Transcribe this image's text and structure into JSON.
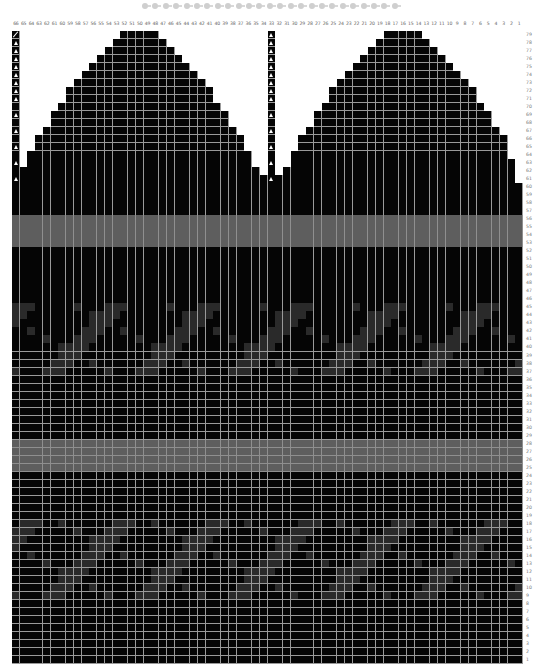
{
  "chart_meta": {
    "title": "Knitting chart",
    "columns": 66,
    "rows": 79,
    "progress_dots": 25
  },
  "column_labels": [
    66,
    65,
    64,
    63,
    62,
    61,
    60,
    59,
    58,
    57,
    56,
    55,
    54,
    53,
    52,
    51,
    50,
    49,
    48,
    47,
    46,
    45,
    44,
    43,
    42,
    41,
    40,
    39,
    38,
    37,
    36,
    35,
    34,
    33,
    32,
    31,
    30,
    29,
    28,
    27,
    26,
    25,
    24,
    23,
    22,
    21,
    20,
    19,
    18,
    17,
    16,
    15,
    14,
    13,
    12,
    11,
    10,
    9,
    8,
    7,
    6,
    5,
    4,
    3,
    2,
    1
  ],
  "row_labels_order": "79 at top down to 1 at bottom",
  "colors": {
    "main": "#050505",
    "background": "#ffffff",
    "grid_line": "#9a9a9a",
    "contrast_dark": "#2a2a2a",
    "band_mid": "#5e5e5e",
    "band_light": "#7b7b7b"
  },
  "shaping": {
    "top_rows": [
      {
        "row": 79,
        "left": [
          52,
          48
        ],
        "right": [
          18,
          14
        ]
      },
      {
        "row": 78,
        "left": [
          53,
          47
        ],
        "right": [
          19,
          13
        ]
      },
      {
        "row": 77,
        "left": [
          54,
          46
        ],
        "right": [
          20,
          12
        ]
      },
      {
        "row": 76,
        "left": [
          55,
          45
        ],
        "right": [
          21,
          11
        ]
      },
      {
        "row": 75,
        "left": [
          56,
          44
        ],
        "right": [
          22,
          10
        ]
      },
      {
        "row": 74,
        "left": [
          57,
          43
        ],
        "right": [
          23,
          9
        ]
      },
      {
        "row": 73,
        "left": [
          58,
          42
        ],
        "right": [
          24,
          8
        ]
      },
      {
        "row": 72,
        "left": [
          59,
          41
        ],
        "right": [
          25,
          7
        ]
      },
      {
        "row": 71,
        "left": [
          59,
          41
        ],
        "right": [
          25,
          7
        ]
      },
      {
        "row": 70,
        "left": [
          60,
          40
        ],
        "right": [
          26,
          6
        ]
      },
      {
        "row": 69,
        "left": [
          61,
          39
        ],
        "right": [
          27,
          5
        ]
      },
      {
        "row": 68,
        "left": [
          61,
          39
        ],
        "right": [
          27,
          5
        ]
      },
      {
        "row": 67,
        "left": [
          62,
          38
        ],
        "right": [
          28,
          4
        ]
      },
      {
        "row": 66,
        "left": [
          63,
          37
        ],
        "right": [
          29,
          3
        ]
      },
      {
        "row": 65,
        "left": [
          63,
          37
        ],
        "right": [
          29,
          3
        ]
      },
      {
        "row": 64,
        "left": [
          64,
          36
        ],
        "right": [
          30,
          3
        ]
      },
      {
        "row": 63,
        "left": [
          64,
          36
        ],
        "right": [
          30,
          2
        ]
      },
      {
        "row": 62,
        "left": [
          65,
          35
        ],
        "right": [
          31,
          2
        ]
      },
      {
        "row": 61,
        "left": [
          65,
          34
        ],
        "right": [
          32,
          2
        ]
      }
    ],
    "decrease_marker_columns": [
      66,
      33
    ],
    "decrease_marker_rows": [
      79,
      78,
      77,
      76,
      75,
      74,
      73,
      72,
      71,
      69,
      67,
      65,
      63,
      61
    ],
    "slash_marker": {
      "row": 79,
      "col": 66
    }
  },
  "bands": [
    {
      "rows": [
        56,
        53
      ],
      "shade": "dark_edges"
    },
    {
      "rows": [
        55,
        54
      ],
      "shade": "light"
    },
    {
      "rows": [
        28,
        25
      ],
      "shade": "dark_edges"
    },
    {
      "rows": [
        27,
        26
      ],
      "shade": "light"
    }
  ],
  "motif_blocks": [
    {
      "rows": [
        45,
        37
      ],
      "period": 12
    },
    {
      "rows": [
        18,
        9
      ],
      "period": 12
    }
  ]
}
